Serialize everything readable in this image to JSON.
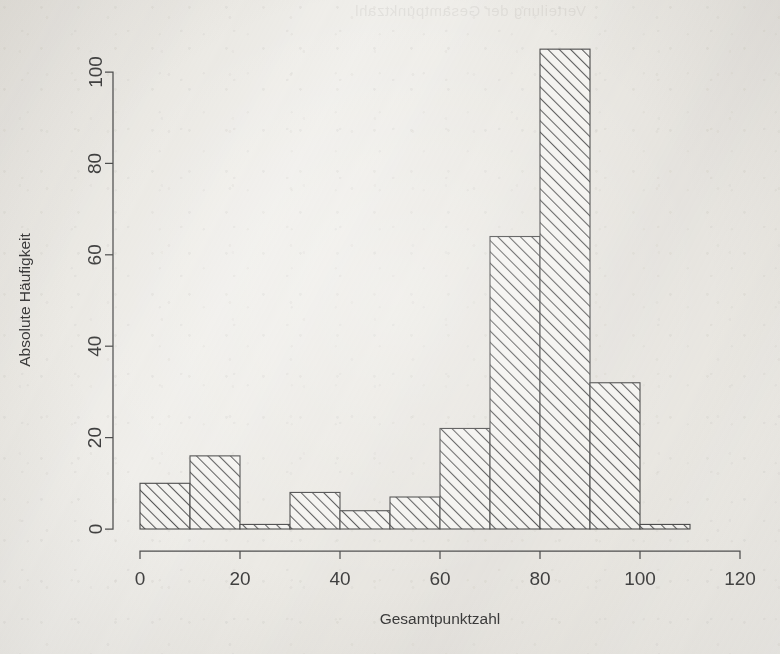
{
  "figure": {
    "kind": "histogram",
    "background_color": "#f2f1ee",
    "ink_color": "#4a4a4a",
    "bleed_through_text": "Verteilung der Gesamtpunktzahl"
  },
  "axes": {
    "x": {
      "title": "Gesamtpunktzahl",
      "ticks": [
        "0",
        "20",
        "40",
        "60",
        "80",
        "100",
        "120"
      ],
      "tick_values": [
        0,
        20,
        40,
        60,
        80,
        100,
        120
      ],
      "range": [
        0,
        120
      ]
    },
    "y": {
      "title": "Absolute Häufigkeit",
      "ticks": [
        "0",
        "20",
        "40",
        "60",
        "80",
        "100"
      ],
      "tick_values": [
        0,
        20,
        40,
        60,
        80,
        100
      ],
      "range": [
        0,
        105
      ]
    }
  },
  "chart_data": {
    "type": "bar",
    "title": "",
    "xlabel": "Gesamtpunktzahl",
    "ylabel": "Absolute Häufigkeit",
    "xlim": [
      0,
      120
    ],
    "ylim": [
      0,
      105
    ],
    "grid": false,
    "legend": false,
    "bin_width": 10,
    "bin_edges": [
      0,
      10,
      20,
      30,
      40,
      50,
      60,
      70,
      80,
      90,
      100,
      110
    ],
    "categories": [
      "0-10",
      "10-20",
      "20-30",
      "30-40",
      "40-50",
      "50-60",
      "60-70",
      "70-80",
      "80-90",
      "90-100",
      "100-110"
    ],
    "values": [
      10,
      16,
      1,
      8,
      4,
      7,
      22,
      64,
      105,
      32,
      1
    ],
    "bar_style": {
      "fill": "hatch-45",
      "fill_color": "#f4f3f0",
      "hatch_color": "#5a5a5a",
      "edge_color": "#4a4a4a"
    }
  }
}
